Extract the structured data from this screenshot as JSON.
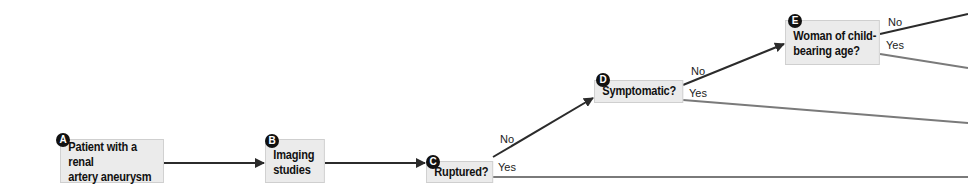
{
  "nodes": [
    {
      "id": "A",
      "label": "Patient with a renal artery aneurysm",
      "lines": [
        "Patient with a renal",
        "artery aneurysm"
      ]
    },
    {
      "id": "B",
      "label": "Imaging studies",
      "lines": [
        "Imaging",
        "studies"
      ]
    },
    {
      "id": "C",
      "label": "Ruptured?",
      "lines": [
        "Ruptured?"
      ]
    },
    {
      "id": "D",
      "label": "Symptomatic?",
      "lines": [
        "Symptomatic?"
      ]
    },
    {
      "id": "E",
      "label": "Woman of child-bearing age?",
      "lines": [
        "Woman of child-",
        "bearing age?"
      ]
    }
  ],
  "edges": [
    {
      "from": "A",
      "to": "B",
      "label": ""
    },
    {
      "from": "B",
      "to": "C",
      "label": ""
    },
    {
      "from": "C",
      "to": "D",
      "label": "No"
    },
    {
      "from": "C",
      "to": "off-right",
      "label": "Yes"
    },
    {
      "from": "D",
      "to": "E",
      "label": "No"
    },
    {
      "from": "D",
      "to": "off-right",
      "label": "Yes"
    },
    {
      "from": "E",
      "to": "off-right",
      "label": "No"
    },
    {
      "from": "E",
      "to": "off-right",
      "label": "Yes"
    }
  ],
  "edge_labels": {
    "c_no": "No",
    "c_yes": "Yes",
    "d_no": "No",
    "d_yes": "Yes",
    "e_no": "No",
    "e_yes": "Yes"
  },
  "colors": {
    "box_fill": "#ebebeb",
    "arrow_dark": "#2b2b2b",
    "line_gray": "#7a7a7a",
    "badge": "#111111"
  }
}
